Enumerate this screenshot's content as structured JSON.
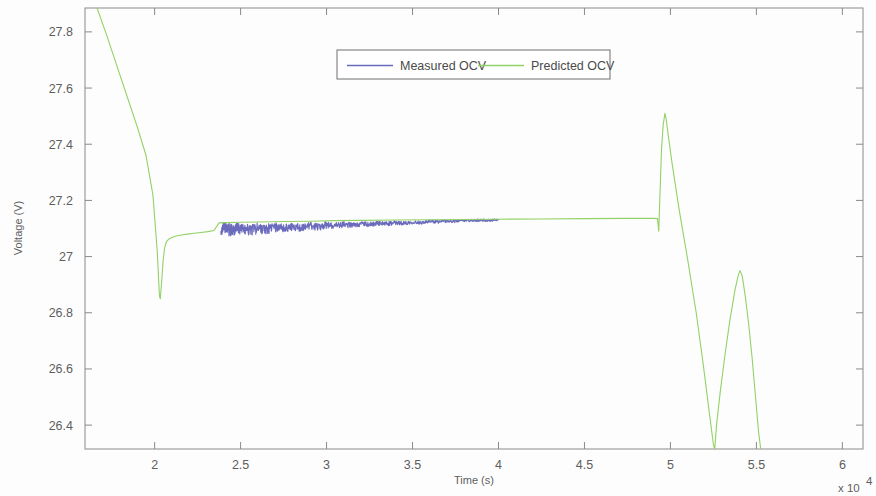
{
  "chart_data": {
    "type": "line",
    "title": "",
    "xlabel": "Time (s)",
    "ylabel": "Voltage (V)",
    "x_exponent_label": "x 10",
    "x_exponent_value": "4",
    "x_tick_labels": [
      "2",
      "2.5",
      "3",
      "3.5",
      "4",
      "4.5",
      "5",
      "5.5",
      "6"
    ],
    "x_tick_values": [
      2,
      2.5,
      3,
      3.5,
      4,
      4.5,
      5,
      5.5,
      6
    ],
    "y_tick_labels": [
      "27.8",
      "27.6",
      "27.4",
      "27.2",
      "27",
      "26.8",
      "26.6",
      "26.4"
    ],
    "y_tick_values": [
      27.8,
      27.6,
      27.4,
      27.2,
      27.0,
      26.8,
      26.6,
      26.4
    ],
    "xlim": [
      1.595,
      6.12
    ],
    "ylim": [
      26.315,
      27.885
    ],
    "grid": false,
    "legend_position": "top-center",
    "series": [
      {
        "name": "Measured OCV",
        "color": "#6b6bbd",
        "points": [
          [
            2.385,
            27.112
          ],
          [
            2.42,
            27.107
          ],
          [
            2.46,
            27.106
          ],
          [
            2.5,
            27.11
          ],
          [
            2.55,
            27.105
          ],
          [
            2.6,
            27.109
          ],
          [
            2.65,
            27.106
          ],
          [
            2.7,
            27.112
          ],
          [
            2.75,
            27.108
          ],
          [
            2.8,
            27.114
          ],
          [
            2.85,
            27.11
          ],
          [
            2.9,
            27.116
          ],
          [
            2.95,
            27.112
          ],
          [
            3.0,
            27.118
          ],
          [
            3.05,
            27.114
          ],
          [
            3.1,
            27.119
          ],
          [
            3.15,
            27.116
          ],
          [
            3.2,
            27.121
          ],
          [
            3.25,
            27.118
          ],
          [
            3.3,
            27.123
          ],
          [
            3.35,
            27.12
          ],
          [
            3.4,
            27.124
          ],
          [
            3.45,
            27.122
          ],
          [
            3.5,
            27.126
          ],
          [
            3.55,
            27.124
          ],
          [
            3.6,
            27.128
          ],
          [
            3.65,
            27.126
          ],
          [
            3.7,
            27.129
          ],
          [
            3.75,
            27.128
          ],
          [
            3.8,
            27.131
          ],
          [
            3.85,
            27.13
          ],
          [
            3.9,
            27.132
          ],
          [
            3.95,
            27.131
          ],
          [
            4.0,
            27.133
          ]
        ]
      },
      {
        "name": "Predicted OCV",
        "color": "#93d165",
        "points": [
          [
            1.665,
            27.885
          ],
          [
            1.72,
            27.79
          ],
          [
            1.78,
            27.68
          ],
          [
            1.84,
            27.57
          ],
          [
            1.9,
            27.46
          ],
          [
            1.95,
            27.36
          ],
          [
            1.99,
            27.22
          ],
          [
            2.015,
            27.02
          ],
          [
            2.028,
            26.86
          ],
          [
            2.033,
            26.85
          ],
          [
            2.042,
            26.92
          ],
          [
            2.05,
            26.99
          ],
          [
            2.058,
            27.03
          ],
          [
            2.068,
            27.052
          ],
          [
            2.082,
            27.062
          ],
          [
            2.1,
            27.068
          ],
          [
            2.125,
            27.073
          ],
          [
            2.155,
            27.077
          ],
          [
            2.19,
            27.08
          ],
          [
            2.23,
            27.083
          ],
          [
            2.27,
            27.086
          ],
          [
            2.31,
            27.089
          ],
          [
            2.345,
            27.093
          ],
          [
            2.375,
            27.12
          ],
          [
            2.42,
            27.121
          ],
          [
            2.5,
            27.122
          ],
          [
            2.6,
            27.123
          ],
          [
            2.75,
            27.125
          ],
          [
            2.9,
            27.126
          ],
          [
            3.05,
            27.128
          ],
          [
            3.2,
            27.129
          ],
          [
            3.4,
            27.13
          ],
          [
            3.6,
            27.131
          ],
          [
            3.8,
            27.132
          ],
          [
            4.0,
            27.133
          ],
          [
            4.25,
            27.134
          ],
          [
            4.5,
            27.135
          ],
          [
            4.75,
            27.136
          ],
          [
            4.9,
            27.136
          ],
          [
            4.925,
            27.135
          ],
          [
            4.932,
            27.09
          ],
          [
            4.938,
            27.2
          ],
          [
            4.948,
            27.38
          ],
          [
            4.958,
            27.47
          ],
          [
            4.968,
            27.51
          ],
          [
            4.975,
            27.49
          ],
          [
            4.99,
            27.42
          ],
          [
            5.01,
            27.33
          ],
          [
            5.05,
            27.17
          ],
          [
            5.1,
            26.99
          ],
          [
            5.15,
            26.8
          ],
          [
            5.19,
            26.62
          ],
          [
            5.225,
            26.45
          ],
          [
            5.25,
            26.33
          ],
          [
            5.258,
            26.315
          ],
          [
            5.268,
            26.4
          ],
          [
            5.29,
            26.52
          ],
          [
            5.315,
            26.64
          ],
          [
            5.345,
            26.77
          ],
          [
            5.375,
            26.88
          ],
          [
            5.395,
            26.935
          ],
          [
            5.405,
            26.95
          ],
          [
            5.418,
            26.93
          ],
          [
            5.435,
            26.86
          ],
          [
            5.455,
            26.76
          ],
          [
            5.475,
            26.64
          ],
          [
            5.495,
            26.5
          ],
          [
            5.512,
            26.38
          ],
          [
            5.525,
            26.315
          ]
        ]
      }
    ],
    "annotations": []
  },
  "legend": {
    "items": [
      {
        "label": "Measured OCV",
        "color": "#6b6bbd"
      },
      {
        "label": "Predicted OCV",
        "color": "#93d165"
      }
    ]
  },
  "axes": {
    "x_title": "Time (s)",
    "y_title": "Voltage (V)",
    "x_multiplier_base": "x 10",
    "x_multiplier_exp": "4"
  }
}
